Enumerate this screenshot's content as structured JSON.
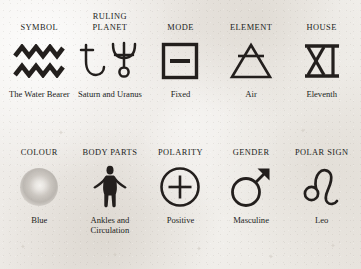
{
  "page": {
    "background_color": "#efece8",
    "text_color": "#231f1d",
    "sign": "Aquarius"
  },
  "attributes": [
    {
      "header": "SYMBOL",
      "icon": "aquarius-water-waves-icon",
      "caption": "The Water Bearer"
    },
    {
      "header": "RULING PLANET",
      "icon": "saturn-and-uranus-planet-icon",
      "caption": "Saturn and Uranus"
    },
    {
      "header": "MODE",
      "icon": "fixed-mode-square-icon",
      "caption": "Fixed"
    },
    {
      "header": "ELEMENT",
      "icon": "air-element-triangle-icon",
      "caption": "Air"
    },
    {
      "header": "HOUSE",
      "icon": "roman-numeral-eleven-icon",
      "caption": "Eleventh"
    },
    {
      "header": "COLOUR",
      "icon": "colour-swatch-icon",
      "caption": "Blue"
    },
    {
      "header": "BODY PARTS",
      "icon": "human-body-figure-icon",
      "caption": "Ankles and Circulation"
    },
    {
      "header": "POLARITY",
      "icon": "positive-plus-circle-icon",
      "caption": "Positive"
    },
    {
      "header": "GENDER",
      "icon": "mars-masculine-icon",
      "caption": "Masculine"
    },
    {
      "header": "POLAR SIGN",
      "icon": "leo-zodiac-glyph-icon",
      "caption": "Leo"
    }
  ]
}
